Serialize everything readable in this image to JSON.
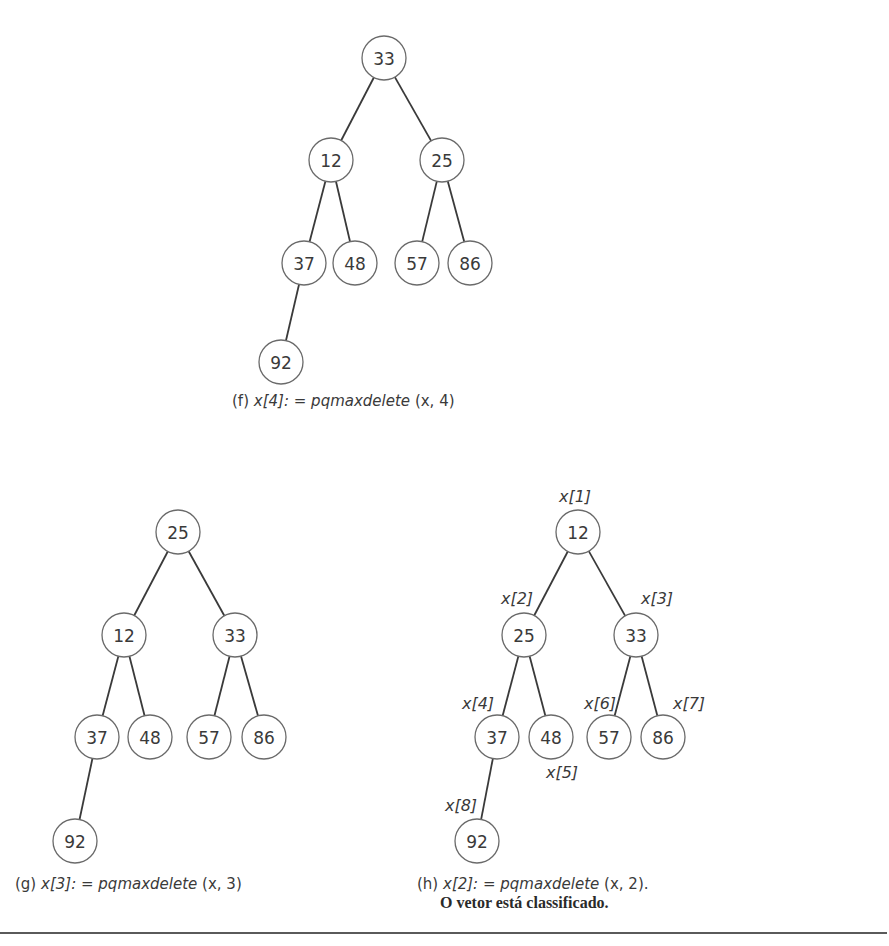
{
  "figure": {
    "panels": [
      {
        "id": "f",
        "caption": {
          "tag": "(f)",
          "lhs": "x[4]:",
          "op": "=",
          "func": "pqmaxdelete",
          "args": "(x, 4)",
          "x": 232,
          "y": 392
        },
        "nodes": [
          {
            "value": "33",
            "cx": 384,
            "cy": 58
          },
          {
            "value": "12",
            "cx": 331,
            "cy": 160
          },
          {
            "value": "25",
            "cx": 442,
            "cy": 160
          },
          {
            "value": "37",
            "cx": 304,
            "cy": 263
          },
          {
            "value": "48",
            "cx": 355,
            "cy": 263
          },
          {
            "value": "57",
            "cx": 417,
            "cy": 263
          },
          {
            "value": "86",
            "cx": 470,
            "cy": 263
          },
          {
            "value": "92",
            "cx": 281,
            "cy": 362
          }
        ],
        "edges": [
          [
            0,
            1
          ],
          [
            0,
            2
          ],
          [
            1,
            3
          ],
          [
            1,
            4
          ],
          [
            2,
            5
          ],
          [
            2,
            6
          ],
          [
            3,
            7
          ]
        ],
        "index_labels": []
      },
      {
        "id": "g",
        "caption": {
          "tag": "(g)",
          "lhs": "x[3]:",
          "op": "=",
          "func": "pqmaxdelete",
          "args": "(x, 3)",
          "x": 15,
          "y": 875
        },
        "nodes": [
          {
            "value": "25",
            "cx": 178,
            "cy": 532
          },
          {
            "value": "12",
            "cx": 124,
            "cy": 635
          },
          {
            "value": "33",
            "cx": 235,
            "cy": 635
          },
          {
            "value": "37",
            "cx": 97,
            "cy": 737
          },
          {
            "value": "48",
            "cx": 150,
            "cy": 737
          },
          {
            "value": "57",
            "cx": 209,
            "cy": 737
          },
          {
            "value": "86",
            "cx": 264,
            "cy": 737
          },
          {
            "value": "92",
            "cx": 75,
            "cy": 841
          }
        ],
        "edges": [
          [
            0,
            1
          ],
          [
            0,
            2
          ],
          [
            1,
            3
          ],
          [
            1,
            4
          ],
          [
            2,
            5
          ],
          [
            2,
            6
          ],
          [
            3,
            7
          ]
        ],
        "index_labels": []
      },
      {
        "id": "h",
        "caption": {
          "tag": "(h)",
          "lhs": "x[2]:",
          "op": "=",
          "func": "pqmaxdelete",
          "args": "(x, 2).",
          "line2": "O vetor está classificado.",
          "x": 417,
          "y": 875
        },
        "nodes": [
          {
            "value": "12",
            "cx": 578,
            "cy": 532
          },
          {
            "value": "25",
            "cx": 524,
            "cy": 635
          },
          {
            "value": "33",
            "cx": 636,
            "cy": 635
          },
          {
            "value": "37",
            "cx": 497,
            "cy": 737
          },
          {
            "value": "48",
            "cx": 551,
            "cy": 737
          },
          {
            "value": "57",
            "cx": 609,
            "cy": 737
          },
          {
            "value": "86",
            "cx": 663,
            "cy": 737
          },
          {
            "value": "92",
            "cx": 477,
            "cy": 841
          }
        ],
        "edges": [
          [
            0,
            1
          ],
          [
            0,
            2
          ],
          [
            1,
            3
          ],
          [
            1,
            4
          ],
          [
            2,
            5
          ],
          [
            2,
            6
          ],
          [
            3,
            7
          ]
        ],
        "index_labels": [
          {
            "text": "x[1]",
            "x": 575,
            "y": 502
          },
          {
            "text": "x[2]",
            "x": 517,
            "y": 604
          },
          {
            "text": "x[3]",
            "x": 657,
            "y": 604
          },
          {
            "text": "x[4]",
            "x": 478,
            "y": 709
          },
          {
            "text": "x[5]",
            "x": 562,
            "y": 778
          },
          {
            "text": "x[6]",
            "x": 600,
            "y": 709
          },
          {
            "text": "x[7]",
            "x": 689,
            "y": 709
          },
          {
            "text": "x[8]",
            "x": 461,
            "y": 811
          }
        ]
      }
    ],
    "node_radius": 22,
    "colors": {
      "stroke": "#6a6a6a",
      "edge": "#3a3a3a",
      "text": "#3a3a3a",
      "background": "#ffffff"
    }
  }
}
